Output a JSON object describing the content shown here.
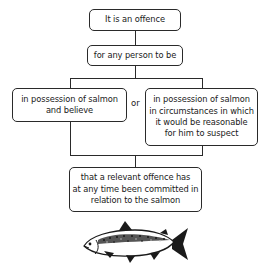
{
  "diagram": {
    "nodes": [
      {
        "id": "n1",
        "text": "It is an offence"
      },
      {
        "id": "n2",
        "text": "for any person to be"
      },
      {
        "id": "n3",
        "text": "in possession of salmon and believe"
      },
      {
        "id": "n4",
        "text": "in possession of salmon in circumstances in which it would be reasonable for him to suspect"
      },
      {
        "id": "n5",
        "text": "that a relevant offence has at any time been committed in relation to the salmon"
      }
    ],
    "connector_label": "or",
    "illustration": "salmon-fish"
  },
  "n3_lines": [
    "in possession of salmon",
    "and believe"
  ],
  "n4_lines": [
    "in possession of salmon",
    "in circumstances in which",
    "it would be reasonable",
    "for him to suspect"
  ],
  "n5_lines": [
    "that a relevant offence has",
    "at any time been committed in",
    "relation to the salmon"
  ]
}
